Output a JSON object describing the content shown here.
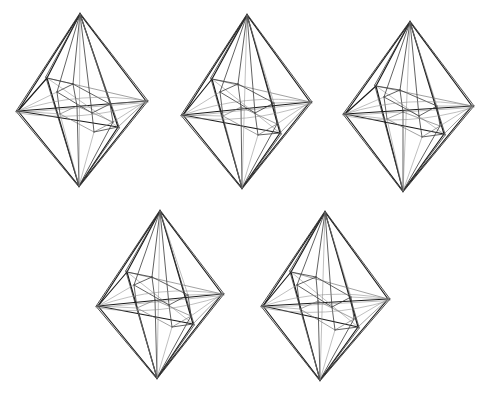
{
  "page": {
    "background_color": "#ffffff",
    "width": 492,
    "height": 399,
    "figure_count": 5
  },
  "style": {
    "outer_edge_color": "#1a1a1a",
    "inner_edge_color": "#3a3a3a",
    "faint_edge_color": "#8a8a8a",
    "stroke_outer": 1.15,
    "stroke_inner": 0.8,
    "stroke_faint": 0.55
  },
  "figures": [
    {
      "id": "figure-1",
      "name": "bipyramid-top-left",
      "row": 1,
      "column": 1,
      "apex_top": [
        80,
        14
      ],
      "apex_bottom": [
        79,
        186
      ],
      "equator": [
        [
          18,
          111
        ],
        [
          47,
          78
        ],
        [
          146,
          101
        ],
        [
          118,
          127
        ]
      ],
      "inner_top": [
        [
          57,
          92
        ],
        [
          73,
          84
        ],
        [
          110,
          104
        ],
        [
          92,
          113
        ]
      ],
      "inner_bottom": [
        [
          60,
          114
        ],
        [
          77,
          106
        ],
        [
          113,
          122
        ],
        [
          94,
          132
        ]
      ],
      "hull_offset": 2.0,
      "tilt": "front-left low"
    },
    {
      "id": "figure-2",
      "name": "bipyramid-top-middle",
      "row": 1,
      "column": 2,
      "apex_top": [
        247,
        15
      ],
      "apex_bottom": [
        242,
        188
      ],
      "equator": [
        [
          183,
          115
        ],
        [
          212,
          79
        ],
        [
          310,
          102
        ],
        [
          280,
          133
        ]
      ],
      "inner_top": [
        [
          220,
          92
        ],
        [
          238,
          84
        ],
        [
          274,
          103
        ],
        [
          255,
          113
        ]
      ],
      "inner_bottom": [
        [
          223,
          116
        ],
        [
          241,
          107
        ],
        [
          277,
          124
        ],
        [
          258,
          135
        ]
      ],
      "hull_offset": 2.0,
      "tilt": "front-left low, rotated"
    },
    {
      "id": "figure-3",
      "name": "bipyramid-top-right",
      "row": 1,
      "column": 3,
      "apex_top": [
        410,
        22
      ],
      "apex_bottom": [
        403,
        191
      ],
      "equator": [
        [
          345,
          114
        ],
        [
          376,
          86
        ],
        [
          472,
          106
        ],
        [
          444,
          134
        ]
      ],
      "inner_top": [
        [
          384,
          97
        ],
        [
          400,
          90
        ],
        [
          437,
          106
        ],
        [
          419,
          116
        ]
      ],
      "inner_bottom": [
        [
          387,
          119
        ],
        [
          403,
          112
        ],
        [
          440,
          126
        ],
        [
          422,
          137
        ]
      ],
      "hull_offset": 2.0,
      "tilt": "front-left low, steeper"
    },
    {
      "id": "figure-4",
      "name": "bipyramid-bottom-left",
      "row": 2,
      "column": 1,
      "apex_top": [
        160,
        211
      ],
      "apex_bottom": [
        157,
        378
      ],
      "equator": [
        [
          98,
          306
        ],
        [
          127,
          272
        ],
        [
          222,
          294
        ],
        [
          193,
          324
        ]
      ],
      "inner_top": [
        [
          134,
          285
        ],
        [
          152,
          277
        ],
        [
          188,
          295
        ],
        [
          169,
          305
        ]
      ],
      "inner_bottom": [
        [
          137,
          308
        ],
        [
          155,
          300
        ],
        [
          191,
          316
        ],
        [
          172,
          327
        ]
      ],
      "hull_offset": 2.0,
      "tilt": "front-left low, shallow"
    },
    {
      "id": "figure-5",
      "name": "bipyramid-bottom-right",
      "row": 2,
      "column": 2,
      "apex_top": [
        325,
        212
      ],
      "apex_bottom": [
        320,
        380
      ],
      "equator": [
        [
          263,
          306
        ],
        [
          291,
          272
        ],
        [
          388,
          299
        ],
        [
          358,
          327
        ]
      ],
      "inner_top": [
        [
          297,
          285
        ],
        [
          316,
          277
        ],
        [
          351,
          297
        ],
        [
          332,
          307
        ]
      ],
      "inner_bottom": [
        [
          300,
          309
        ],
        [
          318,
          301
        ],
        [
          354,
          319
        ],
        [
          335,
          330
        ]
      ],
      "hull_offset": 2.0,
      "tilt": "front-left low, wide"
    }
  ]
}
